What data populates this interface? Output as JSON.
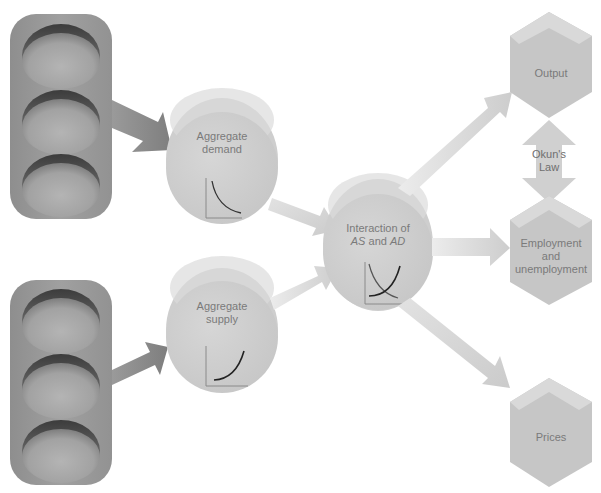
{
  "diagram": {
    "colors": {
      "background": "#ffffff",
      "traffic_light_body": "#9a9a9a",
      "traffic_light_lens": "#a8a8a8",
      "dark_arrow": "#8c8c8c",
      "light_arrow": "#d6d6d6",
      "circle_fill": "#cfcfcf",
      "circle_top": "#dcdcdc",
      "hexagon_fill": "#c6c6c6",
      "hexagon_top": "#d8d8d8",
      "label_text": "#7a7a7a",
      "curve_line": "#222222",
      "axis_line": "#888888"
    },
    "input_panels": [
      {
        "id": "top-input-panel",
        "lights": 3
      },
      {
        "id": "bottom-input-panel",
        "lights": 3
      }
    ],
    "nodes": {
      "aggregate_demand": {
        "line1": "Aggregate",
        "line2": "demand",
        "graph": "downward-sloping-curve"
      },
      "aggregate_supply": {
        "line1": "Aggregate",
        "line2": "supply",
        "graph": "upward-sloping-curve"
      },
      "interaction": {
        "line1": "Interaction of",
        "line2_part1": "AS",
        "line2_part2": " and ",
        "line2_part3": "AD",
        "graph": "crossing-curves"
      }
    },
    "outcomes": {
      "output": {
        "label": "Output"
      },
      "employment": {
        "line1": "Employment",
        "line2": "and",
        "line3": "unemployment"
      },
      "prices": {
        "label": "Prices"
      }
    },
    "okuns_law": {
      "line1": "Okun's",
      "line2": "Law"
    }
  }
}
